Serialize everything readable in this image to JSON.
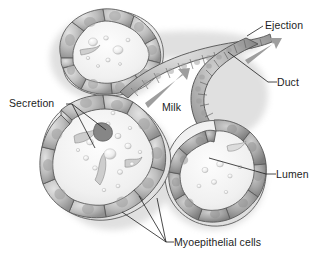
{
  "figure": {
    "background_color": "#ffffff",
    "ink_color": "#1d1d1d",
    "arrow_color": "#9a9a9a",
    "cell_fill_light": "#d8d8d8",
    "cell_fill_mid": "#b4b4b4",
    "cell_fill_dark": "#8c8c8c",
    "outline_color": "#5a5a5a",
    "lumen_fill": "#f2f2f2"
  },
  "labels": {
    "ejection": "Ejection",
    "duct": "Duct",
    "lumen": "Lumen",
    "secretion": "Secretion",
    "milk": "Milk",
    "myoepithelial": "Myoepithelial cells"
  },
  "flow_arrows": [
    {
      "name": "milk-arrow",
      "label": "Milk",
      "from": [
        146,
        101
      ],
      "to": [
        188,
        71
      ]
    },
    {
      "name": "ejection-arrow",
      "label": "Ejection",
      "from": [
        246,
        58
      ],
      "to": [
        279,
        39
      ]
    }
  ],
  "leader_lines": {
    "ejection": [
      [
        263,
        26
      ],
      [
        246,
        36
      ]
    ],
    "duct": [
      [
        275,
        82
      ],
      [
        228,
        52
      ]
    ],
    "lumen": [
      [
        274,
        174
      ],
      [
        209,
        158
      ]
    ],
    "secretion": [
      [
        69,
        104
      ],
      [
        105,
        129
      ],
      [
        93,
        148
      ]
    ],
    "myoepithelial": [
      [
        170,
        242
      ],
      [
        122,
        212
      ],
      [
        138,
        196
      ],
      [
        156,
        198
      ]
    ]
  },
  "structures": [
    {
      "name": "alveolus-upper-left",
      "description": "rounded secretory alveolus with epithelial cells around a milky lumen"
    },
    {
      "name": "alveolus-lower-left",
      "description": "large secretory alveolus filled with milk droplets"
    },
    {
      "name": "alveolus-lower-right",
      "description": "secretory alveolus opening into duct"
    },
    {
      "name": "duct-upper",
      "description": "tubular duct carrying milk toward ejection"
    },
    {
      "name": "duct-right",
      "description": "curved duct branch"
    }
  ]
}
